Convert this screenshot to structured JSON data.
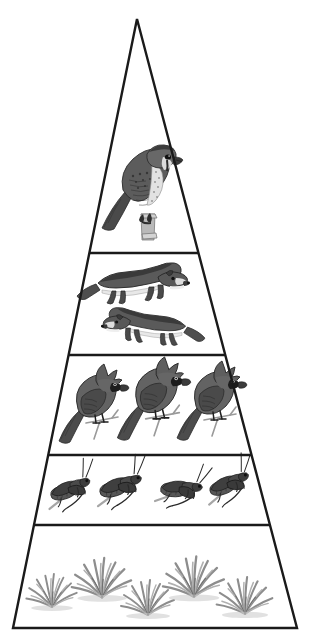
{
  "diagram": {
    "title": "Energy Pyramid",
    "type": "trophic-pyramid",
    "shape": "triangle",
    "apex": {
      "x": 137,
      "y": 19
    },
    "base_left": {
      "x": 13,
      "y": 628
    },
    "base_right": {
      "x": 297,
      "y": 628
    },
    "outline_color": "#1a1a1a",
    "outline_width": 2,
    "background_color": "#ffffff",
    "divider_color": "#1a1a1a",
    "divider_width": 2,
    "divider_y_positions": [
      253,
      355,
      455,
      525
    ],
    "organism_ink_color": "#5a5a5a",
    "organism_dark_color": "#2e2e2e",
    "levels": [
      {
        "index": 1,
        "name": "tertiary-consumers",
        "label": "Hawk",
        "organism": "hawk",
        "count": 1,
        "y_top": 19,
        "y_bottom": 253
      },
      {
        "index": 2,
        "name": "secondary-consumers",
        "label": "Weasels",
        "organism": "weasel",
        "count": 2,
        "y_top": 253,
        "y_bottom": 355
      },
      {
        "index": 3,
        "name": "primary-consumers-birds",
        "label": "Cardinals",
        "organism": "cardinal",
        "count": 3,
        "y_top": 355,
        "y_bottom": 455
      },
      {
        "index": 4,
        "name": "primary-consumers-insects",
        "label": "Grasshoppers",
        "organism": "grasshopper",
        "count": 4,
        "y_top": 455,
        "y_bottom": 525
      },
      {
        "index": 5,
        "name": "producers",
        "label": "Grass",
        "organism": "grass",
        "count": 5,
        "y_top": 525,
        "y_bottom": 628
      }
    ],
    "hawk": {
      "cx": 145,
      "cy": 188,
      "scale": 1.0
    },
    "weasels": [
      {
        "cx": 140,
        "cy": 285,
        "facing": "right",
        "scale": 1.0
      },
      {
        "cx": 147,
        "cy": 328,
        "facing": "left",
        "scale": 0.92
      }
    ],
    "cardinals": [
      {
        "cx": 92,
        "cy": 405,
        "scale": 1.0
      },
      {
        "cx": 152,
        "cy": 400,
        "scale": 1.05
      },
      {
        "cx": 210,
        "cy": 402,
        "scale": 1.0
      }
    ],
    "grasshoppers": [
      {
        "cx": 68,
        "cy": 492,
        "scale": 1.0,
        "rot": -14
      },
      {
        "cx": 118,
        "cy": 489,
        "scale": 1.05,
        "rot": -12
      },
      {
        "cx": 178,
        "cy": 491,
        "scale": 1.0,
        "rot": 5
      },
      {
        "cx": 227,
        "cy": 487,
        "scale": 1.0,
        "rot": -16
      }
    ],
    "grasses": [
      {
        "cx": 52,
        "cy": 590,
        "scale": 0.95
      },
      {
        "cx": 102,
        "cy": 577,
        "scale": 1.12
      },
      {
        "cx": 148,
        "cy": 597,
        "scale": 1.0
      },
      {
        "cx": 194,
        "cy": 576,
        "scale": 1.15
      },
      {
        "cx": 245,
        "cy": 595,
        "scale": 1.05
      }
    ]
  }
}
